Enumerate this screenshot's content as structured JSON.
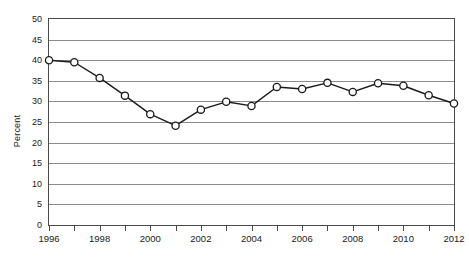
{
  "chart_data": {
    "type": "line",
    "title": "",
    "subtitle": "",
    "xlabel": "",
    "ylabel": "Percent",
    "x": [
      1996,
      1997,
      1998,
      1999,
      2000,
      2001,
      2002,
      2003,
      2004,
      2005,
      2006,
      2007,
      2008,
      2009,
      2010,
      2011,
      2012
    ],
    "values": [
      40.0,
      39.5,
      35.7,
      31.4,
      26.9,
      24.1,
      28.0,
      29.9,
      28.9,
      33.5,
      33.0,
      34.5,
      32.3,
      34.4,
      33.8,
      31.5,
      29.5
    ],
    "series": [
      {
        "name": "Percent",
        "values": [
          40.0,
          39.5,
          35.7,
          31.4,
          26.9,
          24.1,
          28.0,
          29.9,
          28.9,
          33.5,
          33.0,
          34.5,
          32.3,
          34.4,
          33.8,
          31.5,
          29.5
        ]
      }
    ],
    "xlim": [
      1996,
      2012
    ],
    "ylim": [
      0,
      50
    ],
    "ytick_labels": [
      "0",
      "5",
      "10",
      "15",
      "20",
      "25",
      "30",
      "35",
      "40",
      "45",
      "50"
    ],
    "ytick_values": [
      0,
      5,
      10,
      15,
      20,
      25,
      30,
      35,
      40,
      45,
      50
    ],
    "xtick_labels": [
      "1996",
      "1998",
      "2000",
      "2002",
      "2004",
      "2006",
      "2008",
      "2010",
      "2012"
    ],
    "xtick_values": [
      1996,
      1998,
      2000,
      2002,
      2004,
      2006,
      2008,
      2010,
      2012
    ],
    "minor_xtick_values": [
      1997,
      1999,
      2001,
      2003,
      2005,
      2007,
      2009,
      2011
    ],
    "grid": true,
    "grid_axis": "y",
    "legend": false,
    "legend_position": "none",
    "marker": "open-circle",
    "line_color": "#1a1a1a",
    "marker_fill": "#ffffff",
    "marker_edge_color": "#1a1a1a",
    "grid_color": "#8c8c8c",
    "axis_color": "#4a4a4a",
    "background_color": "#ffffff"
  }
}
